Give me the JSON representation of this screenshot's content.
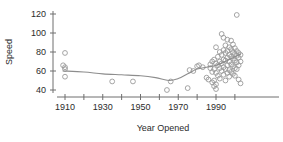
{
  "chart_data": {
    "type": "scatter",
    "title": "",
    "xlabel": "Year Opened",
    "ylabel": "Speed",
    "xlim": [
      1903,
      2005
    ],
    "ylim": [
      36,
      124
    ],
    "grid": false,
    "legend": null,
    "x_ticks_major": [
      1910,
      1930,
      1950,
      1970,
      1990
    ],
    "x_ticks_major_labels": [
      "1910",
      "1930",
      "1950",
      "1970",
      "1990"
    ],
    "x_ticks_minor": [
      1920,
      1940,
      1960,
      1980,
      2000
    ],
    "y_ticks": [
      40,
      60,
      80,
      100,
      120
    ],
    "y_tick_labels": [
      "40",
      "60",
      "80",
      "100",
      "120"
    ],
    "marker": "open-circle",
    "points": [
      {
        "x": 1910,
        "y": 79
      },
      {
        "x": 1909,
        "y": 66
      },
      {
        "x": 1910,
        "y": 64
      },
      {
        "x": 1910,
        "y": 62
      },
      {
        "x": 1910,
        "y": 54
      },
      {
        "x": 1935,
        "y": 49
      },
      {
        "x": 1946,
        "y": 49
      },
      {
        "x": 1964,
        "y": 40
      },
      {
        "x": 1966,
        "y": 49
      },
      {
        "x": 1975,
        "y": 42
      },
      {
        "x": 1976,
        "y": 61
      },
      {
        "x": 1978,
        "y": 60
      },
      {
        "x": 1980,
        "y": 65
      },
      {
        "x": 1981,
        "y": 66
      },
      {
        "x": 1983,
        "y": 64
      },
      {
        "x": 1985,
        "y": 53
      },
      {
        "x": 1986,
        "y": 51
      },
      {
        "x": 1987,
        "y": 67
      },
      {
        "x": 1987,
        "y": 63
      },
      {
        "x": 1988,
        "y": 70
      },
      {
        "x": 1988,
        "y": 59
      },
      {
        "x": 1988,
        "y": 48
      },
      {
        "x": 1989,
        "y": 72
      },
      {
        "x": 1989,
        "y": 62
      },
      {
        "x": 1989,
        "y": 50
      },
      {
        "x": 1989,
        "y": 44
      },
      {
        "x": 1990,
        "y": 85
      },
      {
        "x": 1990,
        "y": 68
      },
      {
        "x": 1990,
        "y": 58
      },
      {
        "x": 1990,
        "y": 46
      },
      {
        "x": 1990,
        "y": 41
      },
      {
        "x": 1991,
        "y": 75
      },
      {
        "x": 1991,
        "y": 66
      },
      {
        "x": 1991,
        "y": 55
      },
      {
        "x": 1992,
        "y": 80
      },
      {
        "x": 1992,
        "y": 70
      },
      {
        "x": 1992,
        "y": 63
      },
      {
        "x": 1992,
        "y": 52
      },
      {
        "x": 1993,
        "y": 99
      },
      {
        "x": 1993,
        "y": 77
      },
      {
        "x": 1993,
        "y": 68
      },
      {
        "x": 1993,
        "y": 60
      },
      {
        "x": 1994,
        "y": 95
      },
      {
        "x": 1994,
        "y": 82
      },
      {
        "x": 1994,
        "y": 72
      },
      {
        "x": 1994,
        "y": 64
      },
      {
        "x": 1994,
        "y": 56
      },
      {
        "x": 1995,
        "y": 87
      },
      {
        "x": 1995,
        "y": 79
      },
      {
        "x": 1995,
        "y": 71
      },
      {
        "x": 1995,
        "y": 62
      },
      {
        "x": 1995,
        "y": 50
      },
      {
        "x": 1996,
        "y": 93
      },
      {
        "x": 1996,
        "y": 81
      },
      {
        "x": 1996,
        "y": 74
      },
      {
        "x": 1996,
        "y": 66
      },
      {
        "x": 1996,
        "y": 58
      },
      {
        "x": 1997,
        "y": 85
      },
      {
        "x": 1997,
        "y": 77
      },
      {
        "x": 1997,
        "y": 70
      },
      {
        "x": 1997,
        "y": 61
      },
      {
        "x": 1997,
        "y": 54
      },
      {
        "x": 1998,
        "y": 92
      },
      {
        "x": 1998,
        "y": 83
      },
      {
        "x": 1998,
        "y": 75
      },
      {
        "x": 1998,
        "y": 67
      },
      {
        "x": 1998,
        "y": 59
      },
      {
        "x": 1999,
        "y": 88
      },
      {
        "x": 1999,
        "y": 80
      },
      {
        "x": 1999,
        "y": 73
      },
      {
        "x": 1999,
        "y": 65
      },
      {
        "x": 1999,
        "y": 57
      },
      {
        "x": 2000,
        "y": 84
      },
      {
        "x": 2000,
        "y": 78
      },
      {
        "x": 2000,
        "y": 71
      },
      {
        "x": 2000,
        "y": 63
      },
      {
        "x": 2000,
        "y": 55
      },
      {
        "x": 2001,
        "y": 119
      },
      {
        "x": 2001,
        "y": 81
      },
      {
        "x": 2001,
        "y": 76
      },
      {
        "x": 2001,
        "y": 69
      },
      {
        "x": 2001,
        "y": 62
      },
      {
        "x": 2002,
        "y": 79
      },
      {
        "x": 2002,
        "y": 74
      },
      {
        "x": 2002,
        "y": 66
      },
      {
        "x": 2002,
        "y": 51
      },
      {
        "x": 2003,
        "y": 77
      },
      {
        "x": 2003,
        "y": 70
      },
      {
        "x": 2003,
        "y": 47
      }
    ],
    "trend_line": {
      "name": "smoother",
      "points": [
        {
          "x": 1909,
          "y": 60
        },
        {
          "x": 1920,
          "y": 59
        },
        {
          "x": 1930,
          "y": 57
        },
        {
          "x": 1940,
          "y": 56
        },
        {
          "x": 1950,
          "y": 55
        },
        {
          "x": 1958,
          "y": 53
        },
        {
          "x": 1965,
          "y": 50
        },
        {
          "x": 1970,
          "y": 52
        },
        {
          "x": 1975,
          "y": 57
        },
        {
          "x": 1980,
          "y": 62
        },
        {
          "x": 1985,
          "y": 64
        },
        {
          "x": 1990,
          "y": 66
        },
        {
          "x": 1995,
          "y": 70
        },
        {
          "x": 2000,
          "y": 75
        },
        {
          "x": 2003,
          "y": 78
        }
      ]
    }
  },
  "colors": {
    "marker_stroke": "#9a9a9a",
    "trend_stroke": "#8d8d8d",
    "axis": "#6e6e6e",
    "text": "#2b2b2b",
    "background": "#ffffff"
  }
}
